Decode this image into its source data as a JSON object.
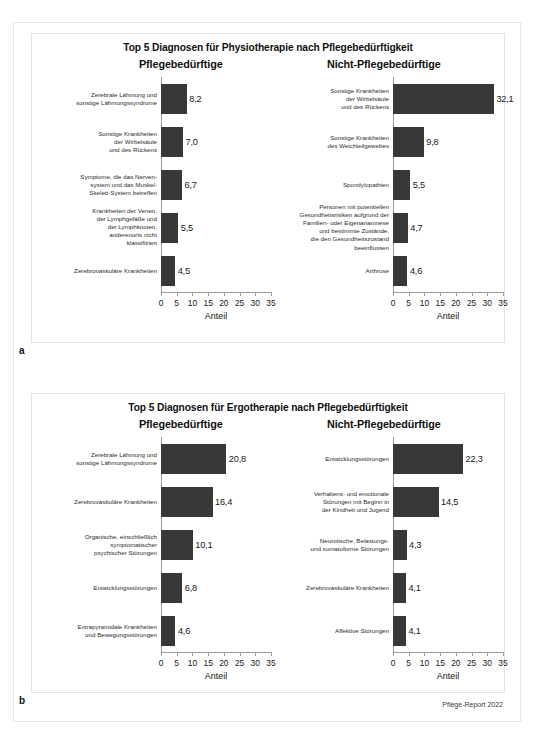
{
  "page": {
    "footer_credit": "Pflege-Report 2022",
    "bar_color": "#383838",
    "axis_color": "#9a9a9a",
    "frame_color": "#e2e2e2"
  },
  "figures": [
    {
      "key": "a",
      "label": "a",
      "title": "Top 5 Diagnosen für Physiotherapie nach Pflegebedürftigkeit",
      "panels": [
        {
          "key": "left",
          "subtitle": "Pflegebedürftige",
          "axis_title": "Anteil",
          "categories": [
            "Zerebrale Lähmung und\nsonstige Lähmungssyndrome",
            "Sonstige Krankheiten\nder Wirbelsäule\nund des Rückens",
            "Symptome, die das Nerven-\nsystem und das Muskel-\nSkelett-System betreffen",
            "Krankheiten der Venen,\nder Lymphgefäße und\nder Lymphknoten,\nanderenorts nicht\nklassifiziert",
            "Zerebrovaskuläre Krankheiten"
          ],
          "values": [
            8.2,
            7.0,
            6.7,
            5.5,
            4.5
          ],
          "value_labels": [
            "8,2",
            "7,0",
            "6,7",
            "5,5",
            "4,5"
          ]
        },
        {
          "key": "right",
          "subtitle": "Nicht-Pflegebedürftige",
          "axis_title": "Anteil",
          "categories": [
            "Sonstige Krankheiten\nder Wirbelsäule\nund des Rückens",
            "Sonstige Krankheiten\ndes Weichteilgewebes",
            "Spondylopathien",
            "Personen mit potentiellen\nGesundheitsrisiken aufgrund der\nFamilien- oder Eigenanamnese\nund bestimmte Zustände,\ndie den Gesundheitszustand\nbeeinflussen",
            "Arthrose"
          ],
          "values": [
            32.1,
            9.8,
            5.5,
            4.7,
            4.6
          ],
          "value_labels": [
            "32,1",
            "9,8",
            "5,5",
            "4,7",
            "4,6"
          ]
        }
      ]
    },
    {
      "key": "b",
      "label": "b",
      "title": "Top 5 Diagnosen für Ergotherapie nach Pflegebedürftigkeit",
      "panels": [
        {
          "key": "left",
          "subtitle": "Pflegebedürftige",
          "axis_title": "Anteil",
          "categories": [
            "Zerebrale Lähmung und\nsonstige Lähmungssyndrome",
            "Zerebrovaskuläre Krankheiten",
            "Organische, einschließlich\nsymptomatischer\npsychischer Störungen",
            "Entwicklungsstörungen",
            "Extrapyramidale Krankheiten\nund Bewegungsstörungen"
          ],
          "values": [
            20.8,
            16.4,
            10.1,
            6.8,
            4.6
          ],
          "value_labels": [
            "20,8",
            "16,4",
            "10,1",
            "6,8",
            "4,6"
          ]
        },
        {
          "key": "right",
          "subtitle": "Nicht-Pflegebedürftige",
          "axis_title": "Anteil",
          "categories": [
            "Entwicklungsstörungen",
            "Verhaltens- und emotionale\nStörungen mit Beginn in\nder Kindheit und Jugend",
            "Neurotische, Belastungs-\nund somatoforme Störungen",
            "Zerebrovaskuläre Krankheiten",
            "Affektive Störungen"
          ],
          "values": [
            22.3,
            14.5,
            4.3,
            4.1,
            4.1
          ],
          "value_labels": [
            "22,3",
            "14,5",
            "4,3",
            "4,1",
            "4,1"
          ]
        }
      ]
    }
  ],
  "chart_data": [
    {
      "type": "bar",
      "orientation": "horizontal",
      "id": "a-left",
      "title": "Top 5 Diagnosen für Physiotherapie nach Pflegebedürftigkeit",
      "subtitle": "Pflegebedürftige",
      "xlabel": "Anteil",
      "ylabel": "",
      "xlim": [
        0,
        35
      ],
      "xticks": [
        0,
        5,
        10,
        15,
        20,
        25,
        30,
        35
      ],
      "grid": false,
      "legend": "none",
      "categories": [
        "Zerebrale Lähmung und sonstige Lähmungssyndrome",
        "Sonstige Krankheiten der Wirbelsäule und des Rückens",
        "Symptome, die das Nervensystem und das Muskel-Skelett-System betreffen",
        "Krankheiten der Venen, der Lymphgefäße und der Lymphknoten, anderenorts nicht klassifiziert",
        "Zerebrovaskuläre Krankheiten"
      ],
      "values": [
        8.2,
        7.0,
        6.7,
        5.5,
        4.5
      ]
    },
    {
      "type": "bar",
      "orientation": "horizontal",
      "id": "a-right",
      "title": "Top 5 Diagnosen für Physiotherapie nach Pflegebedürftigkeit",
      "subtitle": "Nicht-Pflegebedürftige",
      "xlabel": "Anteil",
      "ylabel": "",
      "xlim": [
        0,
        35
      ],
      "xticks": [
        0,
        5,
        10,
        15,
        20,
        25,
        30,
        35
      ],
      "grid": false,
      "legend": "none",
      "categories": [
        "Sonstige Krankheiten der Wirbelsäule und des Rückens",
        "Sonstige Krankheiten des Weichteilgewebes",
        "Spondylopathien",
        "Personen mit potentiellen Gesundheitsrisiken aufgrund der Familien- oder Eigenanamnese und bestimmte Zustände, die den Gesundheitszustand beeinflussen",
        "Arthrose"
      ],
      "values": [
        32.1,
        9.8,
        5.5,
        4.7,
        4.6
      ]
    },
    {
      "type": "bar",
      "orientation": "horizontal",
      "id": "b-left",
      "title": "Top 5 Diagnosen für Ergotherapie nach Pflegebedürftigkeit",
      "subtitle": "Pflegebedürftige",
      "xlabel": "Anteil",
      "ylabel": "",
      "xlim": [
        0,
        35
      ],
      "xticks": [
        0,
        5,
        10,
        15,
        20,
        25,
        30,
        35
      ],
      "grid": false,
      "legend": "none",
      "categories": [
        "Zerebrale Lähmung und sonstige Lähmungssyndrome",
        "Zerebrovaskuläre Krankheiten",
        "Organische, einschließlich symptomatischer psychischer Störungen",
        "Entwicklungsstörungen",
        "Extrapyramidale Krankheiten und Bewegungsstörungen"
      ],
      "values": [
        20.8,
        16.4,
        10.1,
        6.8,
        4.6
      ]
    },
    {
      "type": "bar",
      "orientation": "horizontal",
      "id": "b-right",
      "title": "Top 5 Diagnosen für Ergotherapie nach Pflegebedürftigkeit",
      "subtitle": "Nicht-Pflegebedürftige",
      "xlabel": "Anteil",
      "ylabel": "",
      "xlim": [
        0,
        35
      ],
      "xticks": [
        0,
        5,
        10,
        15,
        20,
        25,
        30,
        35
      ],
      "grid": false,
      "legend": "none",
      "categories": [
        "Entwicklungsstörungen",
        "Verhaltens- und emotionale Störungen mit Beginn in der Kindheit und Jugend",
        "Neurotische, Belastungs- und somatoforme Störungen",
        "Zerebrovaskuläre Krankheiten",
        "Affektive Störungen"
      ],
      "values": [
        22.3,
        14.5,
        4.3,
        4.1,
        4.1
      ]
    }
  ]
}
